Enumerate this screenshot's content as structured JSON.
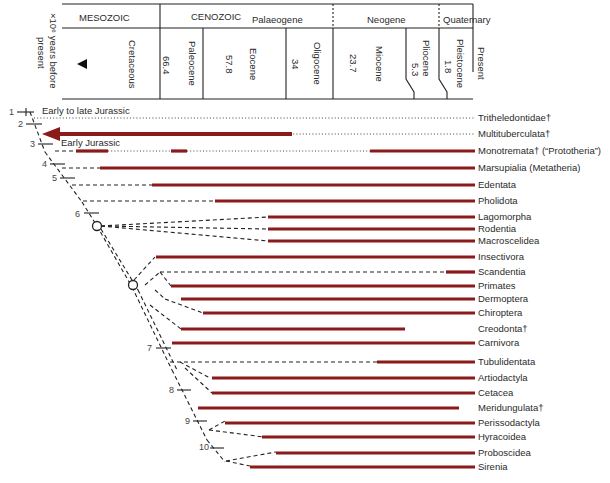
{
  "header": {
    "axis_label": "×10⁶ years before present",
    "eras": [
      {
        "label": "MESOZOIC"
      },
      {
        "label": "CENOZOIC"
      }
    ],
    "periods": [
      {
        "label": "Palaeogene"
      },
      {
        "label": "Neogene"
      },
      {
        "label": "Quaternary"
      }
    ],
    "epochs": [
      {
        "label": "Cretaceous"
      },
      {
        "label": "Paleocene",
        "age": "66.4"
      },
      {
        "label": "Eocene",
        "age": "57.8"
      },
      {
        "label": "Oligocene",
        "age": "34"
      },
      {
        "label": "Miocene",
        "age": "23.7"
      },
      {
        "label": "Pliocene",
        "age": "5.3"
      },
      {
        "label": "Pleistocene",
        "age": "1.8"
      },
      {
        "label": "Present"
      }
    ]
  },
  "annotations": {
    "early_to_late_jurassic": "Early to late Jurassic",
    "early_jurassic": "Early Jurassic"
  },
  "nodes": [
    "1",
    "2",
    "3",
    "4",
    "5",
    "6",
    "7",
    "8",
    "9",
    "10"
  ],
  "taxa": [
    {
      "name": "Tritheledontidae†"
    },
    {
      "name": "Multituberculata†"
    },
    {
      "name": "Monotremata† (“Prototheria”)"
    },
    {
      "name": "Marsupialia (Metatheria)"
    },
    {
      "name": "Edentata"
    },
    {
      "name": "Pholidota"
    },
    {
      "name": "Lagomorpha"
    },
    {
      "name": "Rodentia"
    },
    {
      "name": "Macroscelidea"
    },
    {
      "name": "Insectivora"
    },
    {
      "name": "Scandentia"
    },
    {
      "name": "Primates"
    },
    {
      "name": "Dermoptera"
    },
    {
      "name": "Chiroptera"
    },
    {
      "name": "Creodonta†"
    },
    {
      "name": "Carnivora"
    },
    {
      "name": "Tubulidentata"
    },
    {
      "name": "Artiodactyla"
    },
    {
      "name": "Cetacea"
    },
    {
      "name": "Meridungulata†"
    },
    {
      "name": "Perissodactyla"
    },
    {
      "name": "Hyracoidea"
    },
    {
      "name": "Proboscidea"
    },
    {
      "name": "Sirenia"
    }
  ],
  "colors": {
    "bar": "#8b1a1a",
    "line": "#222222"
  }
}
